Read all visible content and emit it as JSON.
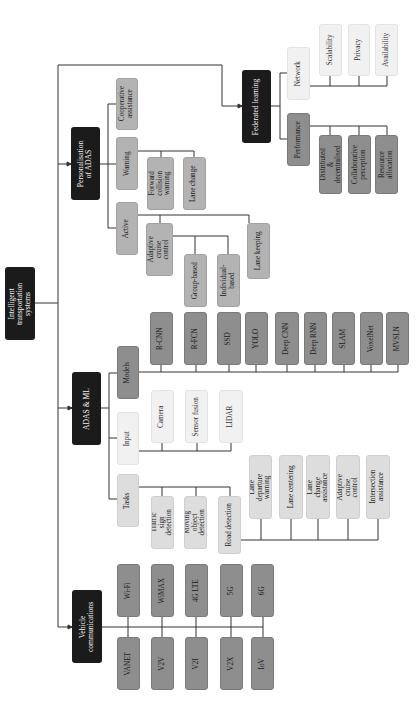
{
  "root": {
    "label": "Intelligent transportation systems"
  },
  "personalisation": {
    "label": "Personalisation of ADAS",
    "cooperative": "Cooperative assistance",
    "warning": {
      "label": "Warning",
      "children": [
        "Forward collision warning",
        "Lane change"
      ]
    },
    "active": {
      "label": "Active",
      "adaptive": {
        "label": "Adaptive cruise control",
        "children": [
          "Group-based",
          "Individual-based"
        ]
      },
      "lane_keeping": "Lane keeping"
    }
  },
  "federated": {
    "label": "Federated learning",
    "network": {
      "label": "Network",
      "children": [
        "Scalability",
        "Privacy",
        "Availability"
      ]
    },
    "performance": {
      "label": "Performance",
      "children": [
        "Distributed & decentralised",
        "Collaborative perception",
        "Resource allocation"
      ]
    }
  },
  "adas_ml": {
    "label": "ADAS & ML",
    "models": {
      "label": "Models",
      "children": [
        "R-CNN",
        "R-FCN",
        "SSD",
        "YOLO",
        "Deep CNN",
        "Deep RNN",
        "SLAM",
        "VoxelNet",
        "MVSLN"
      ]
    },
    "input": {
      "label": "Input",
      "children": [
        "Camera",
        "Sensor fusion",
        "LIDAR"
      ]
    },
    "tasks": {
      "label": "Tasks",
      "children": [
        "Traffic sign detection",
        "Moving object detection",
        "Road detection"
      ],
      "road_children": [
        "Lane departure warning",
        "Lane centering",
        "Lane change assistance",
        "Adaptive cruise control",
        "Intersection assistance"
      ]
    }
  },
  "vehicle_comm": {
    "label": "Vehicle communications",
    "top": [
      "Wi-Fi",
      "WiMAX",
      "4G LTE",
      "5G",
      "6G"
    ],
    "bottom": [
      "VANET",
      "V2V",
      "V2I",
      "V2X",
      "IoV"
    ]
  }
}
